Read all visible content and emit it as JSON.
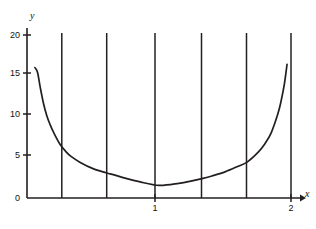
{
  "figure": {
    "background_color": "#ffffff",
    "line_color": "#231f20",
    "width": 316,
    "height": 229
  },
  "axes": {
    "y_axis_name": "y",
    "x_axis_name": "x"
  },
  "chart_data": {
    "type": "line",
    "title": "",
    "xlabel": "x",
    "ylabel": "y",
    "xlim": [
      0,
      2.12
    ],
    "ylim": [
      0,
      21
    ],
    "grid": false,
    "legend": null,
    "y_ticks": [
      0,
      5,
      10,
      15,
      20
    ],
    "y_tick_labels": [
      "0",
      "5",
      "10",
      "15",
      "20"
    ],
    "x_ticks": [
      1,
      2
    ],
    "x_tick_labels": [
      "1",
      "2"
    ],
    "series": [
      {
        "name": "curve",
        "x": [
          0.06,
          0.08,
          0.1,
          0.125,
          0.15,
          0.175,
          0.2,
          0.25,
          0.3,
          0.3333,
          0.4,
          0.5,
          0.6,
          0.6667,
          0.75,
          0.85,
          1.0,
          1.15,
          1.25,
          1.3333,
          1.4,
          1.5,
          1.6,
          1.6667,
          1.75,
          1.8,
          1.85,
          1.9,
          1.925,
          1.95,
          1.97
        ],
        "y": [
          16.0,
          15.4,
          13.6,
          11.6,
          10.1,
          9.0,
          8.1,
          6.6,
          5.6,
          5.1,
          4.4,
          3.6,
          3.1,
          2.8,
          2.4,
          2.0,
          1.55,
          1.8,
          2.1,
          2.4,
          2.7,
          3.2,
          3.9,
          4.4,
          5.6,
          6.6,
          8.0,
          10.3,
          11.9,
          14.0,
          16.4
        ]
      }
    ],
    "vertical_partition_lines": {
      "name": "partition-lines",
      "x_positions": [
        0.3333,
        0.6667,
        1.0,
        1.3333,
        1.6667,
        2.0
      ],
      "y_top": 20.3,
      "y_bottom": 0
    },
    "annotations": []
  }
}
